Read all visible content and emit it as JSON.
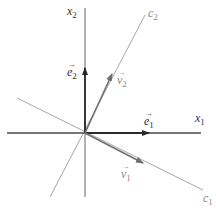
{
  "diagram": {
    "type": "vector-basis-diagram",
    "origin": [
      85,
      133
    ],
    "colors": {
      "axis": "#3a3a3a",
      "basis_vector": "#2a2a2a",
      "eigen_line": "#a0a0a0",
      "eigen_vector": "#6e6e6e",
      "background": "#ffffff"
    },
    "axes": {
      "x1": {
        "label": "x",
        "subscript": "1"
      },
      "x2": {
        "label": "x",
        "subscript": "2"
      }
    },
    "vectors": {
      "e1": {
        "label": "e",
        "subscript": "1",
        "arrow": "→"
      },
      "e2": {
        "label": "e",
        "subscript": "2",
        "arrow": "→"
      },
      "v1": {
        "label": "v",
        "subscript": "1",
        "arrow": "→"
      },
      "v2": {
        "label": "v",
        "subscript": "2",
        "arrow": "→"
      }
    },
    "lines": {
      "c1": {
        "label": "c",
        "subscript": "1"
      },
      "c2": {
        "label": "c",
        "subscript": "2"
      }
    }
  }
}
